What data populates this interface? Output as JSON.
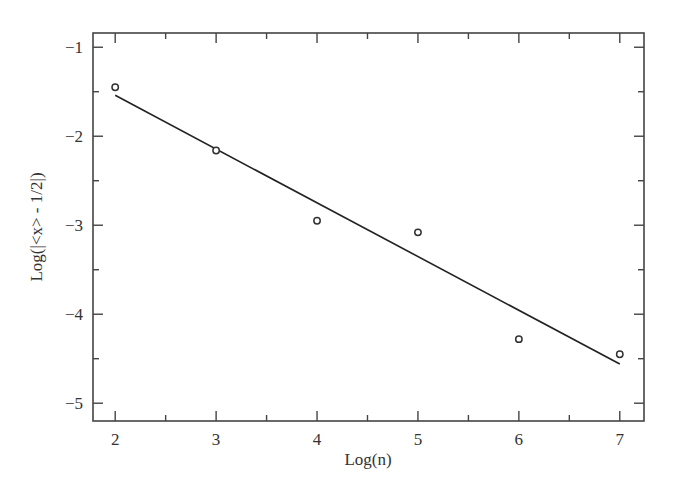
{
  "chart_data": {
    "type": "scatter",
    "title": "",
    "xlabel": "Log(n)",
    "ylabel": "Log(|<x> - 1/2|)",
    "xlim": [
      1.78,
      7.24
    ],
    "ylim": [
      -5.2,
      -0.84
    ],
    "x_ticks": [
      2,
      3,
      4,
      5,
      6,
      7
    ],
    "x_tick_labels": [
      "2",
      "3",
      "4",
      "5",
      "6",
      "7"
    ],
    "x_minor_ticks": [
      2.5,
      3.5,
      4.5,
      5.5,
      6.5
    ],
    "y_ticks": [
      -1,
      -2,
      -3,
      -4,
      -5
    ],
    "y_tick_labels": [
      "−1",
      "−2",
      "−3",
      "−4",
      "−5"
    ],
    "y_minor_ticks": [
      -1.5,
      -2.5,
      -3.5,
      -4.5
    ],
    "grid": false,
    "legend": null,
    "series": [
      {
        "name": "data",
        "marker": "open-circle",
        "x": [
          2,
          3,
          4,
          5,
          6,
          7
        ],
        "y": [
          -1.45,
          -2.16,
          -2.95,
          -3.08,
          -4.28,
          -4.45
        ]
      },
      {
        "name": "linear fit",
        "style": "line",
        "x": [
          2,
          7
        ],
        "y": [
          -1.54,
          -4.56
        ]
      }
    ]
  }
}
